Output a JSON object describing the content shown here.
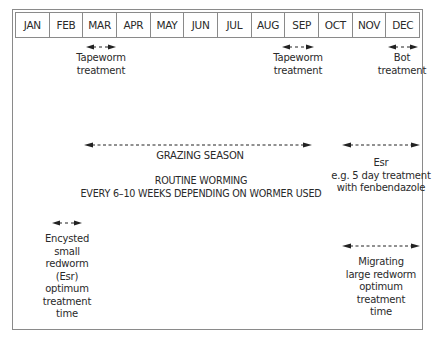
{
  "months": [
    "JAN",
    "FEB",
    "MAR",
    "APR",
    "MAY",
    "JUN",
    "JUL",
    "AUG",
    "SEP",
    "OCT",
    "NOV",
    "DEC"
  ],
  "annotations": {
    "tapeworm_spring": "Tapeworm\ntreatment",
    "tapeworm_autumn": "Tapeworm\ntreatment",
    "bot": "Bot\ntreatment",
    "grazing": "GRAZING SEASON",
    "routine": "ROUTINE WORMING\nEVERY 6–10 WEEKS DEPENDING ON WORMER USED",
    "esr_autumn": "Esr\ne.g. 5 day treatment\nwith fenbendazole",
    "esr_winter": "Encysted\nsmall\nredworm\n(Esr)\noptimum\ntreatment\ntime",
    "migrating": "Migrating\nlarge redworm\noptimum\ntreatment\ntime"
  },
  "colors": {
    "line": "#8a8a8a",
    "text": "#2a2a2a",
    "arrow": "#222222"
  }
}
